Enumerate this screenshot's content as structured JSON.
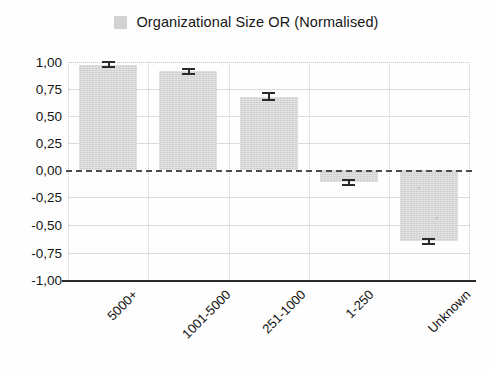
{
  "chart_data": {
    "type": "bar",
    "title": "",
    "subtitle": "",
    "xlabel": "",
    "ylabel": "",
    "categories": [
      "5000+",
      "1001-5000",
      "251-1000",
      "1-250",
      "Unknown"
    ],
    "series": [
      {
        "name": "Organizational Size OR (Normalised)",
        "values": [
          0.96,
          0.9,
          0.67,
          -0.11,
          -0.65
        ],
        "errors": [
          0.02,
          0.02,
          0.04,
          0.03,
          0.03
        ],
        "color": "#d6d6d6"
      }
    ],
    "ylim": [
      -1.0,
      1.0
    ],
    "yticks": [
      1.0,
      0.75,
      0.5,
      0.25,
      0.0,
      -0.25,
      -0.5,
      -0.75,
      -1.0
    ],
    "ytick_labels": [
      "1,00",
      "0,75",
      "0,50",
      "0,25",
      "0,00",
      "-0,25",
      "-0,50",
      "-0,75",
      "-1,00"
    ],
    "grid": true,
    "grid_axis": "both",
    "zero_line": true,
    "zero_line_style": "dashed",
    "error_bars": true,
    "legend_position": "top-center",
    "decimal_separator": ","
  },
  "legend": {
    "entries": [
      {
        "label": "Organizational Size OR (Normalised)",
        "color": "#d6d6d6"
      }
    ]
  },
  "axes": {
    "y_tick_labels": [
      "1,00",
      "0,75",
      "0,50",
      "0,25",
      "0,00",
      "-0,25",
      "-0,50",
      "-0,75",
      "-1,00"
    ],
    "x_tick_labels": [
      "5000+",
      "1001-5000",
      "251-1000",
      "1-250",
      "Unknown"
    ]
  },
  "colors": {
    "bar_fill": "#d6d6d6",
    "legend_swatch": "#d2d2d2",
    "grid": "#c9c9c9",
    "zero_line": "#4c4c4c",
    "axis": "#2a2a2a",
    "error_bar": "#2b2b2b",
    "text": "#151515",
    "background": "#fefefe"
  }
}
